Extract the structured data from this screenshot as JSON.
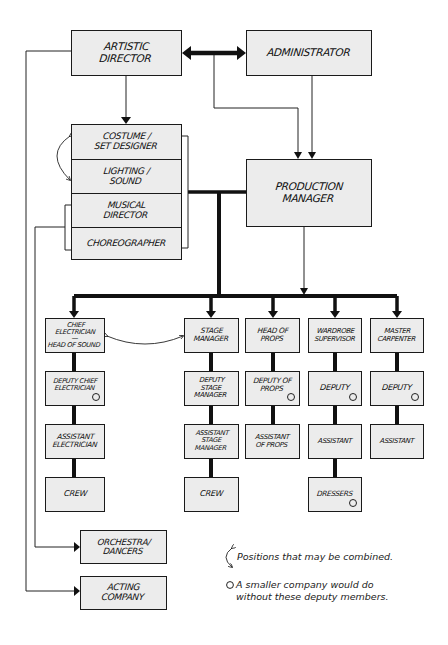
{
  "diagram": {
    "type": "organization-chart",
    "top": {
      "artistic_director": "ARTISTIC\nDIRECTOR",
      "administrator": "ADMINISTRATOR"
    },
    "creative_team": [
      {
        "label": "COSTUME /\nSET DESIGNER"
      },
      {
        "label": "LIGHTING /\nSOUND"
      },
      {
        "label": "MUSICAL\nDIRECTOR"
      },
      {
        "label": "CHOREOGRAPHER"
      }
    ],
    "production_manager": "PRODUCTION\nMANAGER",
    "departments": [
      {
        "head": "CHIEF\nELECTRICIAN\n—\nHEAD of SOUND",
        "chain": [
          {
            "label": "DEPUTY CHIEF\nELECTRICIAN",
            "optional": true
          },
          {
            "label": "ASSISTANT\nELECTRICIAN",
            "optional": false
          },
          {
            "label": "CREW",
            "optional": false
          }
        ]
      },
      {
        "head": "STAGE\nMANAGER",
        "chain": [
          {
            "label": "DEPUTY\nSTAGE\nMANAGER",
            "optional": false
          },
          {
            "label": "ASSISTANT\nSTAGE\nMANAGER",
            "optional": false
          },
          {
            "label": "CREW",
            "optional": false
          }
        ]
      },
      {
        "head": "HEAD OF\nPROPS",
        "chain": [
          {
            "label": "DEPUTY OF\nPROPS",
            "optional": true
          },
          {
            "label": "ASSISTANT\nOF PROPS",
            "optional": false
          }
        ]
      },
      {
        "head": "WARDROBE\nSUPERVISOR",
        "chain": [
          {
            "label": "DEPUTY",
            "optional": true
          },
          {
            "label": "ASSISTANT",
            "optional": false
          },
          {
            "label": "DRESSERS",
            "optional": true
          }
        ]
      },
      {
        "head": "MASTER\nCARPENTER",
        "chain": [
          {
            "label": "DEPUTY",
            "optional": true
          },
          {
            "label": "ASSISTANT",
            "optional": false
          }
        ]
      }
    ],
    "performers": {
      "orchestra": "ORCHESTRA/\nDANCERS",
      "acting": "ACTING\nCOMPANY"
    },
    "legend": {
      "combined": "Positions that may be combined.",
      "deputy": "A smaller company would do\nwithout these deputy members."
    },
    "colors": {
      "box_fill": "#ececec",
      "line": "#111111",
      "background": "#ffffff"
    }
  }
}
